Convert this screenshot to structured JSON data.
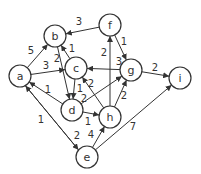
{
  "graph": {
    "type": "directed-weighted",
    "node_radius": 11,
    "colors": {
      "stroke": "#333333",
      "fill": "#ffffff",
      "text": "#333333"
    },
    "nodes": [
      {
        "id": "a",
        "label": "a",
        "x": 20,
        "y": 76
      },
      {
        "id": "b",
        "label": "b",
        "x": 55,
        "y": 36
      },
      {
        "id": "c",
        "label": "c",
        "x": 76,
        "y": 68
      },
      {
        "id": "d",
        "label": "d",
        "x": 72,
        "y": 110
      },
      {
        "id": "e",
        "label": "e",
        "x": 87,
        "y": 157
      },
      {
        "id": "f",
        "label": "f",
        "x": 110,
        "y": 25
      },
      {
        "id": "g",
        "label": "g",
        "x": 131,
        "y": 70
      },
      {
        "id": "h",
        "label": "h",
        "x": 110,
        "y": 117
      },
      {
        "id": "i",
        "label": "i",
        "x": 180,
        "y": 78
      }
    ],
    "edges": [
      {
        "from": "f",
        "to": "b",
        "weight": "3",
        "lx": 79,
        "ly": 21,
        "off": 0
      },
      {
        "from": "a",
        "to": "b",
        "weight": "5",
        "lx": 31,
        "ly": 50,
        "off": 0
      },
      {
        "from": "b",
        "to": "d",
        "weight": "2",
        "lx": 57,
        "ly": 58,
        "off": 0
      },
      {
        "from": "c",
        "to": "b",
        "weight": "1",
        "lx": 72,
        "ly": 48,
        "off": 0
      },
      {
        "from": "a",
        "to": "c",
        "weight": "3",
        "lx": 46,
        "ly": 65,
        "off": 0
      },
      {
        "from": "g",
        "to": "c",
        "weight": "3",
        "lx": 119,
        "ly": 61,
        "off": 0
      },
      {
        "from": "h",
        "to": "c",
        "weight": "2",
        "lx": 91,
        "ly": 83,
        "off": 0
      },
      {
        "from": "c",
        "to": "d",
        "weight": "1",
        "lx": 80,
        "ly": 88,
        "off": 0
      },
      {
        "from": "d",
        "to": "a",
        "weight": "1",
        "lx": 48,
        "ly": 89,
        "off": 0
      },
      {
        "from": "e",
        "to": "a",
        "weight": "1",
        "lx": 41,
        "ly": 119,
        "off": -2
      },
      {
        "from": "a",
        "to": "e",
        "weight": "2",
        "lx": 77,
        "ly": 135,
        "off": 2
      },
      {
        "from": "d",
        "to": "h",
        "weight": "1",
        "lx": 88,
        "ly": 121,
        "off": 0
      },
      {
        "from": "d",
        "to": "g",
        "weight": "2",
        "lx": 84,
        "ly": 98,
        "off": 0
      },
      {
        "from": "h",
        "to": "g",
        "weight": "2",
        "lx": 124,
        "ly": 95,
        "off": 0
      },
      {
        "from": "h",
        "to": "f",
        "weight": "2",
        "lx": 104,
        "ly": 52,
        "off": 0
      },
      {
        "from": "f",
        "to": "g",
        "weight": "1",
        "lx": 124,
        "ly": 41,
        "off": 0
      },
      {
        "from": "g",
        "to": "i",
        "weight": "2",
        "lx": 155,
        "ly": 67,
        "off": 0
      },
      {
        "from": "e",
        "to": "h",
        "weight": "4",
        "lx": 91,
        "ly": 134,
        "off": 0
      },
      {
        "from": "e",
        "to": "i",
        "weight": "7",
        "lx": 133,
        "ly": 126,
        "off": 0
      }
    ]
  }
}
